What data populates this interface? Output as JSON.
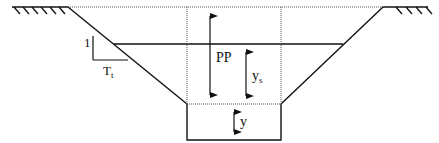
{
  "diagram": {
    "labels": {
      "slope_vertical": "1",
      "slope_horizontal": "T",
      "slope_horizontal_sub": "t",
      "total_depth": "PP",
      "water_depth": "y",
      "water_depth_sub": "s",
      "trench_depth": "y"
    },
    "colors": {
      "line": "#111111",
      "dotted": "#555555",
      "background": "#ffffff"
    }
  }
}
